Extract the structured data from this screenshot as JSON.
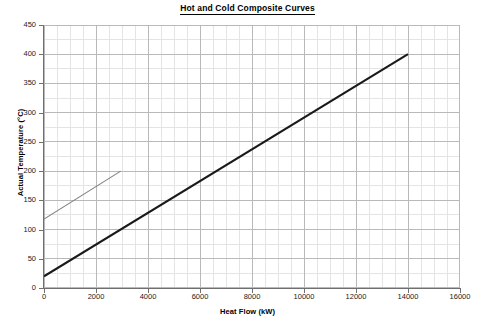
{
  "chart_data": {
    "type": "line",
    "title": "Hot and Cold Composite Curves",
    "xlabel": "Heat Flow (kW)",
    "ylabel": "Actual Temperature (°C)",
    "xlim": [
      0,
      16000
    ],
    "ylim": [
      0,
      450
    ],
    "xticks": [
      0,
      2000,
      4000,
      6000,
      8000,
      10000,
      12000,
      14000,
      16000
    ],
    "yticks": [
      0,
      50,
      100,
      150,
      200,
      250,
      300,
      350,
      400,
      450
    ],
    "xtick_labels": [
      "0",
      "2000",
      "4000",
      "6000",
      "8000",
      "10000",
      "12000",
      "14000",
      "16000"
    ],
    "ytick_labels": [
      "0",
      "50",
      "100",
      "150",
      "200",
      "250",
      "300",
      "350",
      "400",
      "450"
    ],
    "grid": true,
    "minor_grid": true,
    "legend": "none",
    "series": [
      {
        "name": "Hot Composite Curve",
        "color": "#1a1a1a",
        "width": 2.1,
        "x": [
          0,
          14000
        ],
        "y": [
          20,
          400
        ]
      },
      {
        "name": "Cold Composite Curve",
        "color": "#808080",
        "width": 1.1,
        "x": [
          0,
          2950
        ],
        "y": [
          118,
          200
        ]
      }
    ]
  },
  "colors": {
    "background": "#ffffff",
    "major_grid": "#b9b9b9",
    "minor_grid": "#e4e4e4",
    "axis": "#6f6f6f",
    "hot_curve": "#1a1a1a",
    "cold_curve": "#808080",
    "text": "#000000"
  }
}
